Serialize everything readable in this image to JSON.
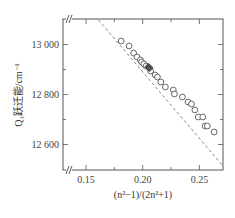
{
  "chart_data": {
    "type": "scatter",
    "title": "",
    "xlabel": "(n²−1)/(2n²+1)",
    "ylabel": "Q₁跃迁能/cm⁻¹",
    "xlim": [
      0.125,
      0.27
    ],
    "ylim": [
      12500,
      13100
    ],
    "x_ticks": [
      0.15,
      0.2,
      0.25
    ],
    "x_tick_labels": [
      "0.15",
      "0.20",
      "0.25"
    ],
    "x_minor_ticks": [
      0.175,
      0.225
    ],
    "y_ticks": [
      12600,
      12800,
      13000
    ],
    "y_tick_labels": [
      "12 600",
      "12 800",
      "13 000"
    ],
    "y_minor_ticks": [
      12700,
      12900
    ],
    "axis_breaks": [
      "x",
      "y"
    ],
    "grid": false,
    "legend": null,
    "series": [
      {
        "name": "measured",
        "marker": "open-circle",
        "points": [
          [
            0.181,
            13014
          ],
          [
            0.188,
            12994
          ],
          [
            0.192,
            12966
          ],
          [
            0.195,
            12950
          ],
          [
            0.198,
            12938
          ],
          [
            0.199,
            12930
          ],
          [
            0.201,
            12922
          ],
          [
            0.203,
            12914
          ],
          [
            0.207,
            12894
          ],
          [
            0.211,
            12878
          ],
          [
            0.213,
            12870
          ],
          [
            0.216,
            12850
          ],
          [
            0.22,
            12830
          ],
          [
            0.227,
            12818
          ],
          [
            0.228,
            12802
          ],
          [
            0.235,
            12790
          ],
          [
            0.24,
            12770
          ],
          [
            0.243,
            12762
          ],
          [
            0.246,
            12738
          ],
          [
            0.249,
            12710
          ],
          [
            0.253,
            12710
          ],
          [
            0.255,
            12674
          ],
          [
            0.257,
            12674
          ],
          [
            0.263,
            12650
          ]
        ]
      },
      {
        "name": "measured-filled",
        "marker": "filled-square",
        "points": [
          [
            0.205,
            12910
          ],
          [
            0.206,
            12906
          ]
        ]
      },
      {
        "name": "linear-fit",
        "style": "dashed",
        "points": [
          [
            0.161,
            13098
          ],
          [
            0.27,
            12518
          ]
        ]
      }
    ]
  }
}
